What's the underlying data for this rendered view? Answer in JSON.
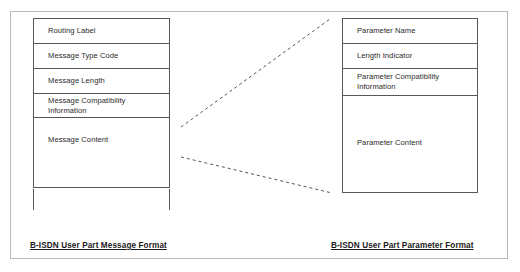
{
  "diagram": {
    "title_left": "B-ISDN User Part Message Format",
    "title_right": "B-ISDN User Part Parameter Format",
    "line_color": "#575757",
    "frame_color": "#b9b9b9",
    "text_color": "#2b2b2b",
    "connector_color": "#555555"
  },
  "message_format": {
    "caption": "B-ISDN User Part Message Format",
    "fields": [
      {
        "label": "Routing Label"
      },
      {
        "label": "Message Type Code"
      },
      {
        "label": "Message Length"
      },
      {
        "label": "Message Compatibility\nInformation"
      },
      {
        "label": "Message Content"
      }
    ]
  },
  "parameter_format": {
    "caption": "B-ISDN User Part Parameter Format",
    "fields": [
      {
        "label": "Parameter Name"
      },
      {
        "label": "Length Indicator"
      },
      {
        "label": "Parameter Compatibility\nInformation"
      },
      {
        "label": "Parameter Content"
      }
    ]
  },
  "connectors": [
    {
      "name": "upper-expansion-line",
      "from_x": 181,
      "from_y": 127,
      "to_x": 330,
      "to_y": 19
    },
    {
      "name": "lower-expansion-line",
      "from_x": 181,
      "from_y": 157,
      "to_x": 332,
      "to_y": 193
    }
  ]
}
